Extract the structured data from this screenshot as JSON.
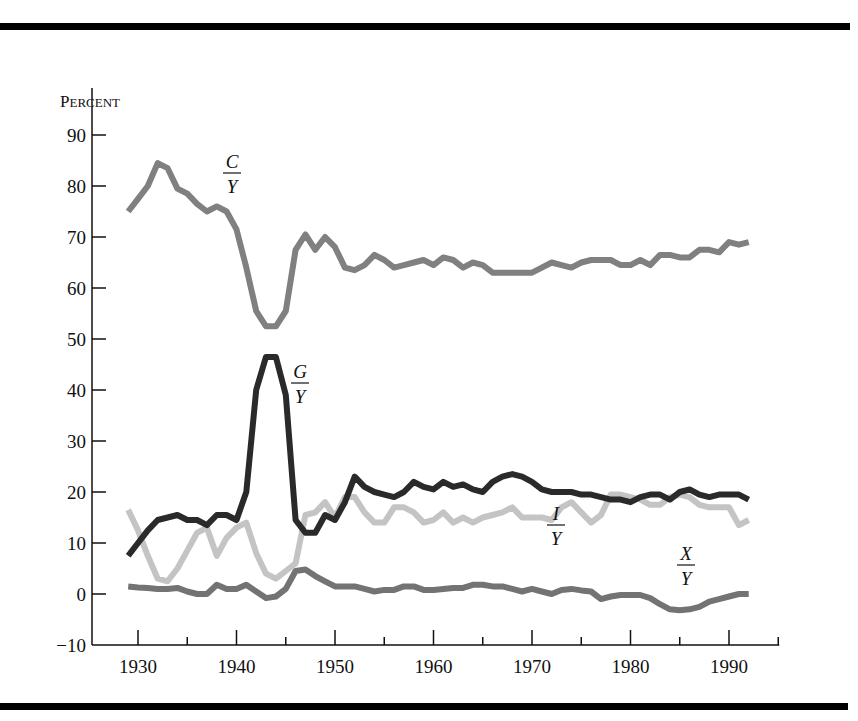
{
  "chart_data": {
    "type": "line",
    "title": "",
    "xlabel": "",
    "ylabel": "Percent",
    "ylabel_display": {
      "first": "P",
      "rest": "ERCENT"
    },
    "xlim": [
      1925,
      1995
    ],
    "ylim": [
      -10,
      100
    ],
    "grid": false,
    "legend": "inline labels",
    "x_ticks_major": [
      1930,
      1940,
      1950,
      1960,
      1970,
      1980,
      1990
    ],
    "x_ticks_minor": [
      1935,
      1945,
      1955,
      1965,
      1975,
      1985,
      1995
    ],
    "y_ticks": [
      -10,
      0,
      10,
      20,
      30,
      40,
      50,
      60,
      70,
      80,
      90
    ],
    "x": [
      1929,
      1930,
      1931,
      1932,
      1933,
      1934,
      1935,
      1936,
      1937,
      1938,
      1939,
      1940,
      1941,
      1942,
      1943,
      1944,
      1945,
      1946,
      1947,
      1948,
      1949,
      1950,
      1951,
      1952,
      1953,
      1954,
      1955,
      1956,
      1957,
      1958,
      1959,
      1960,
      1961,
      1962,
      1963,
      1964,
      1965,
      1966,
      1967,
      1968,
      1969,
      1970,
      1971,
      1972,
      1973,
      1974,
      1975,
      1976,
      1977,
      1978,
      1979,
      1980,
      1981,
      1982,
      1983,
      1984,
      1985,
      1986,
      1987,
      1988,
      1989,
      1990,
      1991,
      1992
    ],
    "series": [
      {
        "name": "C/Y",
        "label_num": "C",
        "label_den": "Y",
        "color": "#808080",
        "width": 6,
        "label_pos": [
          232,
          172
        ],
        "values": [
          75,
          77.5,
          80,
          84.5,
          83.5,
          79.5,
          78.5,
          76.5,
          75,
          76,
          75,
          71.5,
          64,
          55.5,
          52.5,
          52.5,
          55.5,
          67.5,
          70.5,
          67.5,
          70,
          68,
          64,
          63.5,
          64.5,
          66.5,
          65.5,
          64,
          64.5,
          65,
          65.5,
          64.5,
          66,
          65.5,
          64,
          65,
          64.5,
          63,
          63,
          63,
          63,
          63,
          64,
          65,
          64.5,
          64,
          65,
          65.5,
          65.5,
          65.5,
          64.5,
          64.5,
          65.5,
          64.5,
          66.5,
          66.5,
          66,
          66,
          67.5,
          67.5,
          67,
          69,
          68.5,
          69
        ]
      },
      {
        "name": "G/Y",
        "label_num": "G",
        "label_den": "Y",
        "color": "#2a2a2a",
        "width": 6,
        "label_pos": [
          300,
          382
        ],
        "values": [
          7.5,
          10,
          12.5,
          14.5,
          15,
          15.5,
          14.5,
          14.5,
          13.5,
          15.5,
          15.5,
          14.5,
          20,
          40,
          46.5,
          46.5,
          39,
          14.5,
          12,
          12,
          15.5,
          14.5,
          18,
          23,
          21,
          20,
          19.5,
          19,
          20,
          22,
          21,
          20.5,
          22,
          21,
          21.5,
          20.5,
          20,
          22,
          23,
          23.5,
          23,
          22,
          20.5,
          20,
          20,
          20,
          19.5,
          19.5,
          19,
          18.5,
          18.5,
          18,
          19,
          19.5,
          19.5,
          18.5,
          20,
          20.5,
          19.5,
          19,
          19.5,
          19.5,
          19.5,
          18.5
        ]
      },
      {
        "name": "I/Y",
        "label_num": "I",
        "label_den": "Y",
        "color": "#c4c4c4",
        "width": 6,
        "label_pos": [
          556,
          524
        ],
        "values": [
          16.5,
          12.5,
          7.5,
          3,
          2.5,
          5,
          8.5,
          12,
          13,
          7.5,
          11,
          13,
          14,
          8,
          4,
          3,
          4.5,
          6,
          15.5,
          16,
          18,
          15,
          19,
          19,
          16,
          14,
          14,
          17,
          17,
          16,
          14,
          14.5,
          16,
          14,
          15,
          14,
          15,
          15.5,
          16,
          17,
          15,
          15,
          15,
          14.5,
          17,
          18,
          16,
          14,
          15.5,
          19.5,
          19.5,
          19,
          18.5,
          17.5,
          17.5,
          19,
          19.5,
          19,
          17.5,
          17,
          17,
          17,
          13.5,
          14.5
        ]
      },
      {
        "name": "X/Y",
        "label_num": "X",
        "label_den": "Y",
        "color": "#737373",
        "width": 6,
        "label_pos": [
          686,
          564
        ],
        "values": [
          1.5,
          1.3,
          1.2,
          1,
          1,
          1.2,
          0.5,
          0,
          0,
          1.8,
          1,
          1,
          1.8,
          0.5,
          -0.8,
          -0.5,
          1,
          4.5,
          4.8,
          3.5,
          2.5,
          1.5,
          1.5,
          1.5,
          1,
          0.5,
          0.8,
          0.8,
          1.5,
          1.5,
          0.8,
          0.8,
          1,
          1.2,
          1.2,
          1.8,
          1.8,
          1.5,
          1.5,
          1,
          0.5,
          1,
          0.5,
          0,
          0.8,
          1,
          0.7,
          0.5,
          -1,
          -0.5,
          -0.2,
          -0.2,
          -0.2,
          -0.8,
          -2,
          -3,
          -3.2,
          -3,
          -2.5,
          -1.5,
          -1,
          -0.5,
          0,
          0
        ]
      }
    ]
  }
}
